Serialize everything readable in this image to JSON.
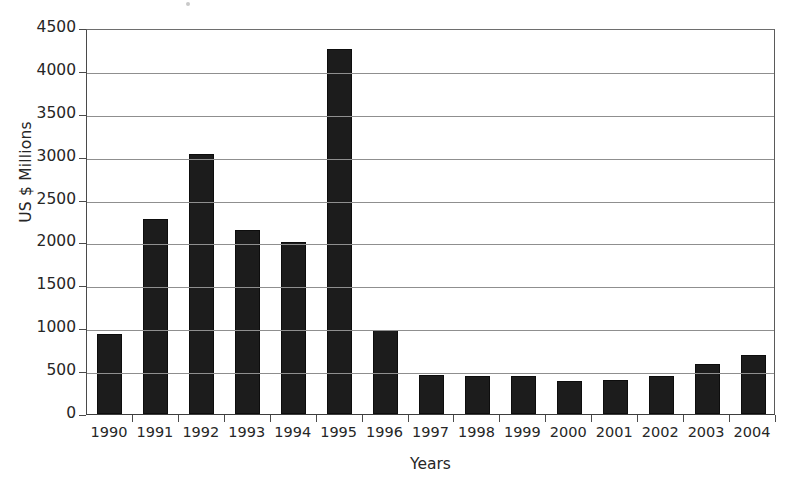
{
  "chart_data": {
    "type": "bar",
    "title": "",
    "subtitle": "",
    "xlabel": "Years",
    "ylabel": "US $ Millions",
    "categories": [
      "1990",
      "1991",
      "1992",
      "1993",
      "1994",
      "1995",
      "1996",
      "1997",
      "1998",
      "1999",
      "2000",
      "2001",
      "2002",
      "2003",
      "2004"
    ],
    "values": [
      930,
      2270,
      3030,
      2150,
      2010,
      4250,
      980,
      455,
      445,
      445,
      380,
      400,
      445,
      580,
      685
    ],
    "ylim": [
      0,
      4500
    ],
    "ytick_labels": [
      "0",
      "500",
      "1000",
      "1500",
      "2000",
      "2500",
      "3000",
      "3500",
      "4000",
      "4500"
    ],
    "ytick_values": [
      0,
      500,
      1000,
      1500,
      2000,
      2500,
      3000,
      3500,
      4000,
      4500
    ],
    "grid": "horizontal",
    "legend": "none",
    "bar_color": "#1c1c1c",
    "axis_color": "#4a4a4a",
    "grid_color": "#8f8f8f",
    "annotations": []
  }
}
